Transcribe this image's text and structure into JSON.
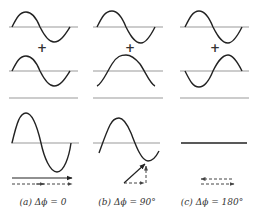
{
  "figure": {
    "columns": [
      {
        "id": "a",
        "caption": "(a) Δϕ = 0",
        "wave1": {
          "phase_deg": 0,
          "amplitude": 1
        },
        "wave2": {
          "phase_deg": 0,
          "amplitude": 1
        },
        "result": {
          "amplitude": 2,
          "description": "constructive interference"
        },
        "phasor": "parallel arrows (solid and dashed, same direction)"
      },
      {
        "id": "b",
        "caption": "(b) Δϕ = 90°",
        "wave1": {
          "phase_deg": 0,
          "amplitude": 1
        },
        "wave2": {
          "phase_deg": 90,
          "amplitude": 1
        },
        "result": {
          "amplitude": 1.414,
          "description": "partial interference"
        },
        "phasor": "right-angle phasor triangle with resultant on hypotenuse"
      },
      {
        "id": "c",
        "caption": "(c) Δϕ = 180°",
        "wave1": {
          "phase_deg": 0,
          "amplitude": 1
        },
        "wave2": {
          "phase_deg": 180,
          "amplitude": 1
        },
        "result": {
          "amplitude": 0,
          "description": "destructive interference (flat line)"
        },
        "phasor": "antiparallel dashed arrows"
      }
    ],
    "plus_symbol": "+",
    "colors": {
      "wave": "#222222",
      "axis": "#999999",
      "text": "#333333"
    }
  }
}
